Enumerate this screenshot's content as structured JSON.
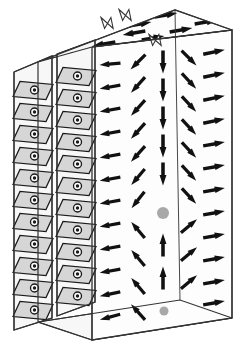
{
  "figure": {
    "canvas": {
      "width": 241,
      "height": 351
    },
    "colors": {
      "background": "#ffffff",
      "outline": "#333333",
      "arrow": "#111111",
      "face_fill": "#fdfdfd",
      "side_face_fill": "#f7f7f7",
      "lens_fill": "#d6d6d6",
      "lens_outline": "#1a1a1a",
      "vortex_core": "#a8a8a8",
      "transition_outline": "#333333",
      "transition_fill": "#ffffff"
    },
    "geometry": {
      "front_face": {
        "label": "front-face",
        "points": "92,47 232,30 232,318 92,340"
      },
      "top_face": {
        "label": "top-face",
        "points": "38,62 175,10 232,30 92,47"
      },
      "bottom_face": {
        "label": "bottom-face",
        "points": "38,322 92,340 232,318 180,300"
      },
      "slab_panels": [
        {
          "label": "slab-panel-1",
          "points": "14,72 52,56 52,318 14,330"
        },
        {
          "label": "slab-panel-2",
          "points": "57,54 95,40 95,302 57,316"
        }
      ],
      "slab_top_edges": [
        {
          "label": "slab-top-edge-1",
          "points": "14,72 52,56"
        },
        {
          "label": "slab-top-edge-2",
          "points": "57,54 95,40"
        }
      ]
    },
    "vortex_cores": [
      {
        "name": "vortex-core-center",
        "cx": 163,
        "cy": 213,
        "r": 6.0
      },
      {
        "name": "vortex-core-bottom",
        "cx": 164,
        "cy": 311,
        "r": 4.5
      }
    ],
    "legend_notes": {
      "lens_symbol_meaning": "magnetization out of plane (dot in circle)",
      "arrow_meaning": "in-plane magnetization direction",
      "core_meaning": "vortex core / Bloch point"
    }
  },
  "chart_data": {
    "type": "scatter",
    "xlabel": "",
    "ylabel": "",
    "grid": false,
    "legend_position": "none",
    "series": [
      {
        "name": "front-face-arrows",
        "description": "In-plane magnetization vectors on the front face; angle in degrees measured counter-clockwise from +x axis.",
        "points": [
          {
            "x": 110,
            "y": 64,
            "angle": 185,
            "len": 21
          },
          {
            "x": 110,
            "y": 87,
            "angle": 190,
            "len": 21
          },
          {
            "x": 110,
            "y": 110,
            "angle": 190,
            "len": 21
          },
          {
            "x": 110,
            "y": 133,
            "angle": 190,
            "len": 21
          },
          {
            "x": 110,
            "y": 156,
            "angle": 190,
            "len": 21
          },
          {
            "x": 110,
            "y": 179,
            "angle": 190,
            "len": 21
          },
          {
            "x": 110,
            "y": 202,
            "angle": 190,
            "len": 21
          },
          {
            "x": 110,
            "y": 225,
            "angle": 190,
            "len": 21
          },
          {
            "x": 110,
            "y": 248,
            "angle": 190,
            "len": 21
          },
          {
            "x": 110,
            "y": 271,
            "angle": 190,
            "len": 21
          },
          {
            "x": 110,
            "y": 294,
            "angle": 192,
            "len": 21
          },
          {
            "x": 110,
            "y": 317,
            "angle": 195,
            "len": 21
          },
          {
            "x": 138,
            "y": 62,
            "angle": 225,
            "len": 21
          },
          {
            "x": 138,
            "y": 85,
            "angle": 228,
            "len": 21
          },
          {
            "x": 138,
            "y": 108,
            "angle": 228,
            "len": 21
          },
          {
            "x": 138,
            "y": 131,
            "angle": 228,
            "len": 21
          },
          {
            "x": 138,
            "y": 154,
            "angle": 228,
            "len": 21
          },
          {
            "x": 138,
            "y": 177,
            "angle": 230,
            "len": 21
          },
          {
            "x": 138,
            "y": 200,
            "angle": 232,
            "len": 21
          },
          {
            "x": 138,
            "y": 230,
            "angle": 130,
            "len": 21
          },
          {
            "x": 138,
            "y": 258,
            "angle": 130,
            "len": 21
          },
          {
            "x": 138,
            "y": 286,
            "angle": 130,
            "len": 21
          },
          {
            "x": 138,
            "y": 312,
            "angle": 132,
            "len": 21
          },
          {
            "x": 163,
            "y": 62,
            "angle": 270,
            "len": 23
          },
          {
            "x": 163,
            "y": 90,
            "angle": 270,
            "len": 23
          },
          {
            "x": 163,
            "y": 118,
            "angle": 270,
            "len": 23
          },
          {
            "x": 163,
            "y": 146,
            "angle": 270,
            "len": 23
          },
          {
            "x": 163,
            "y": 174,
            "angle": 270,
            "len": 23
          },
          {
            "x": 163,
            "y": 245,
            "angle": 90,
            "len": 23
          },
          {
            "x": 163,
            "y": 278,
            "angle": 90,
            "len": 23
          },
          {
            "x": 189,
            "y": 58,
            "angle": 315,
            "len": 21
          },
          {
            "x": 189,
            "y": 81,
            "angle": 313,
            "len": 21
          },
          {
            "x": 189,
            "y": 104,
            "angle": 313,
            "len": 21
          },
          {
            "x": 189,
            "y": 127,
            "angle": 313,
            "len": 21
          },
          {
            "x": 189,
            "y": 150,
            "angle": 313,
            "len": 21
          },
          {
            "x": 189,
            "y": 173,
            "angle": 313,
            "len": 21
          },
          {
            "x": 189,
            "y": 196,
            "angle": 313,
            "len": 21
          },
          {
            "x": 189,
            "y": 226,
            "angle": 40,
            "len": 21
          },
          {
            "x": 189,
            "y": 254,
            "angle": 40,
            "len": 21
          },
          {
            "x": 189,
            "y": 282,
            "angle": 40,
            "len": 21
          },
          {
            "x": 214,
            "y": 52,
            "angle": 12,
            "len": 22
          },
          {
            "x": 214,
            "y": 75,
            "angle": 12,
            "len": 22
          },
          {
            "x": 214,
            "y": 98,
            "angle": 12,
            "len": 22
          },
          {
            "x": 214,
            "y": 121,
            "angle": 12,
            "len": 22
          },
          {
            "x": 214,
            "y": 144,
            "angle": 10,
            "len": 22
          },
          {
            "x": 214,
            "y": 167,
            "angle": 10,
            "len": 22
          },
          {
            "x": 214,
            "y": 190,
            "angle": 10,
            "len": 22
          },
          {
            "x": 214,
            "y": 213,
            "angle": 10,
            "len": 22
          },
          {
            "x": 214,
            "y": 236,
            "angle": 10,
            "len": 22
          },
          {
            "x": 214,
            "y": 259,
            "angle": 10,
            "len": 22
          },
          {
            "x": 214,
            "y": 282,
            "angle": 10,
            "len": 22
          },
          {
            "x": 214,
            "y": 303,
            "angle": 10,
            "len": 22
          }
        ]
      },
      {
        "name": "top-face-arrows",
        "description": "Magnetization vectors drawn in perspective on the top face; left region points left, right region points right.",
        "points": [
          {
            "x": 62,
            "y": 41,
            "angle": 190,
            "len": 23
          },
          {
            "x": 92,
            "y": 30,
            "angle": 190,
            "len": 23
          },
          {
            "x": 74,
            "y": 55,
            "angle": 190,
            "len": 23
          },
          {
            "x": 104,
            "y": 44,
            "angle": 190,
            "len": 23
          },
          {
            "x": 134,
            "y": 33,
            "angle": 190,
            "len": 23
          },
          {
            "x": 140,
            "y": 24,
            "angle": 10,
            "len": 23
          },
          {
            "x": 166,
            "y": 15,
            "angle": 10,
            "len": 23
          },
          {
            "x": 153,
            "y": 38,
            "angle": 10,
            "len": 23
          },
          {
            "x": 181,
            "y": 30,
            "angle": 10,
            "len": 23
          },
          {
            "x": 206,
            "y": 22,
            "angle": 10,
            "len": 23
          },
          {
            "x": 211,
            "y": 40,
            "angle": 10,
            "len": 23
          }
        ]
      },
      {
        "name": "side-panel-out-of-plane-symbols",
        "description": "Lens (parallelogram) cells each carrying a circle-with-dot glyph: magnetization pointing out of the plane.",
        "columns": 2,
        "rows": 11,
        "panel_1_cells": [
          {
            "x": 33,
            "y": 90
          },
          {
            "x": 33,
            "y": 112
          },
          {
            "x": 33,
            "y": 134
          },
          {
            "x": 33,
            "y": 156
          },
          {
            "x": 33,
            "y": 178
          },
          {
            "x": 33,
            "y": 200
          },
          {
            "x": 33,
            "y": 222
          },
          {
            "x": 33,
            "y": 244
          },
          {
            "x": 33,
            "y": 266
          },
          {
            "x": 33,
            "y": 288
          },
          {
            "x": 33,
            "y": 310
          }
        ],
        "panel_2_cells": [
          {
            "x": 76,
            "y": 76
          },
          {
            "x": 76,
            "y": 98
          },
          {
            "x": 76,
            "y": 120
          },
          {
            "x": 76,
            "y": 142
          },
          {
            "x": 76,
            "y": 164
          },
          {
            "x": 76,
            "y": 186
          },
          {
            "x": 76,
            "y": 208
          },
          {
            "x": 76,
            "y": 230
          },
          {
            "x": 76,
            "y": 252
          },
          {
            "x": 76,
            "y": 274
          },
          {
            "x": 76,
            "y": 296
          }
        ]
      },
      {
        "name": "domain-wall-transition-marks",
        "description": "Outlined bow-tie marks on the top face where magnetization reverses (domain walls).",
        "points": [
          {
            "x": 110,
            "y": 23
          },
          {
            "x": 158,
            "y": 40
          },
          {
            "x": 128,
            "y": 15
          }
        ]
      }
    ]
  }
}
